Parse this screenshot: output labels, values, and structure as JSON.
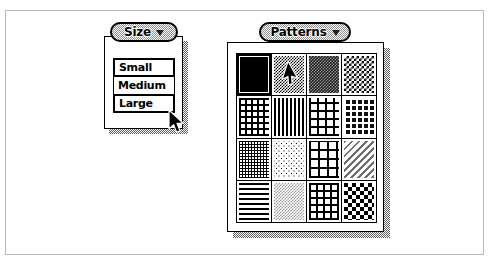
{
  "app": {
    "title": "Size and Patterns palettes",
    "background_color": "#ffffff",
    "frame_color": "#b9b9b9"
  },
  "size_palette": {
    "title": "Size",
    "caret_icon": "triangle-down-icon",
    "selected_value": "Large",
    "options": [
      {
        "label": "Small",
        "emphasized": true
      },
      {
        "label": "Medium",
        "emphasized": false
      },
      {
        "label": "Large",
        "emphasized": true
      }
    ]
  },
  "patterns_palette": {
    "title": "Patterns",
    "caret_icon": "triangle-down-icon",
    "columns": 4,
    "rows": 4,
    "selected_index": 0,
    "hovered_index": 1,
    "swatches": [
      {
        "name": "solid-black",
        "css": "pat-solid-black",
        "selected": true
      },
      {
        "name": "checkerboard-50",
        "css": "pat-checker50",
        "selected": false
      },
      {
        "name": "dense-dark-grain",
        "css": "pat-dense-dark",
        "selected": false
      },
      {
        "name": "checkerboard-med",
        "css": "pat-checker-med",
        "selected": false
      },
      {
        "name": "grid-dots",
        "css": "pat-grid-dots",
        "selected": false
      },
      {
        "name": "vertical-stripes",
        "css": "pat-vstripes",
        "selected": false
      },
      {
        "name": "open-weave",
        "css": "pat-weave-open",
        "selected": false
      },
      {
        "name": "dark-dot-grid",
        "css": "pat-dark-dots",
        "selected": false
      },
      {
        "name": "fine-crosshatch",
        "css": "pat-fine-crosshatch",
        "selected": false
      },
      {
        "name": "light-speckle",
        "css": "pat-light-speckle",
        "selected": false
      },
      {
        "name": "brick-weave",
        "css": "pat-brick",
        "selected": false
      },
      {
        "name": "diagonal-hatch",
        "css": "pat-diagonal",
        "selected": false
      },
      {
        "name": "horizontal-stripes",
        "css": "pat-hstripes",
        "selected": false
      },
      {
        "name": "grey-dither",
        "css": "pat-dither-grey",
        "selected": false
      },
      {
        "name": "wide-grid",
        "css": "pat-grid-wide",
        "selected": false
      },
      {
        "name": "large-checker",
        "css": "pat-checker-big",
        "selected": false
      }
    ]
  },
  "cursors": [
    {
      "name": "arrow-pointer-size-menu",
      "x": 168,
      "y": 109
    },
    {
      "name": "arrow-pointer-patterns-grid",
      "x": 282,
      "y": 62
    }
  ]
}
